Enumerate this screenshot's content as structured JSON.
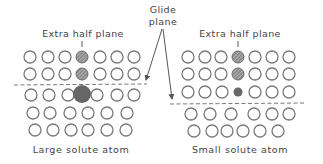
{
  "title_glide": [
    "Glide",
    "plane"
  ],
  "panels": [
    {
      "id": "left",
      "top_label": "Extra half plane",
      "bottom_label": "Large solute atom",
      "top_label_pos": {
        "x": 83,
        "y": 37
      },
      "bottom_label_pos": {
        "x": 81,
        "y": 153
      },
      "marker_x": 82,
      "glide_line": {
        "x1": 14,
        "y1": 85,
        "x2": 147,
        "y2": 84
      },
      "rows": [
        {
          "y": 57,
          "xs": [
            30,
            48,
            65,
            100,
            117,
            134
          ]
        },
        {
          "y": 74,
          "xs": [
            30,
            48,
            65,
            100,
            117,
            134
          ]
        },
        {
          "y": 95,
          "xs": [
            31,
            49,
            68,
            97,
            117,
            134
          ]
        },
        {
          "y": 113,
          "xs": [
            33,
            50,
            70,
            88,
            107,
            127
          ]
        },
        {
          "y": 130,
          "xs": [
            35,
            53,
            71,
            88,
            107,
            126
          ]
        }
      ],
      "hatched": [
        {
          "x": 82,
          "y": 57,
          "r": 6
        },
        {
          "x": 82,
          "y": 74,
          "r": 6
        }
      ],
      "solute": {
        "x": 82,
        "y": 94,
        "r": 9,
        "type": "large"
      }
    },
    {
      "id": "right",
      "top_label": "Extra half plane",
      "bottom_label": "Small solute atom",
      "top_label_pos": {
        "x": 240,
        "y": 37
      },
      "bottom_label_pos": {
        "x": 240,
        "y": 153
      },
      "marker_x": 238,
      "glide_line": {
        "x1": 170,
        "y1": 104,
        "x2": 306,
        "y2": 103
      },
      "rows": [
        {
          "y": 57,
          "xs": [
            188,
            205,
            221,
            255,
            272,
            289
          ]
        },
        {
          "y": 74,
          "xs": [
            188,
            205,
            221,
            255,
            272,
            289
          ]
        },
        {
          "y": 92,
          "xs": [
            188,
            205,
            222,
            255,
            272,
            289
          ]
        },
        {
          "y": 114,
          "xs": [
            191,
            210,
            231,
            254,
            272,
            289
          ]
        },
        {
          "y": 131,
          "xs": [
            194,
            212,
            227,
            243,
            260,
            278
          ]
        }
      ],
      "hatched": [
        {
          "x": 238,
          "y": 57,
          "r": 6
        },
        {
          "x": 238,
          "y": 74,
          "r": 6
        }
      ],
      "solute": {
        "x": 238,
        "y": 92,
        "r": 4.5,
        "type": "small"
      }
    }
  ],
  "glide_label_pos": {
    "x": 163,
    "y1": 13,
    "y2": 25
  },
  "glide_arrows": [
    {
      "from": {
        "x": 162,
        "y": 29
      },
      "to": {
        "x": 146,
        "y": 80
      }
    },
    {
      "from": {
        "x": 163,
        "y": 29
      },
      "to": {
        "x": 172,
        "y": 99
      }
    }
  ],
  "colors": {
    "atom_stroke": "#7a7a7a",
    "solute_fill": "#666666",
    "text": "#444444"
  }
}
